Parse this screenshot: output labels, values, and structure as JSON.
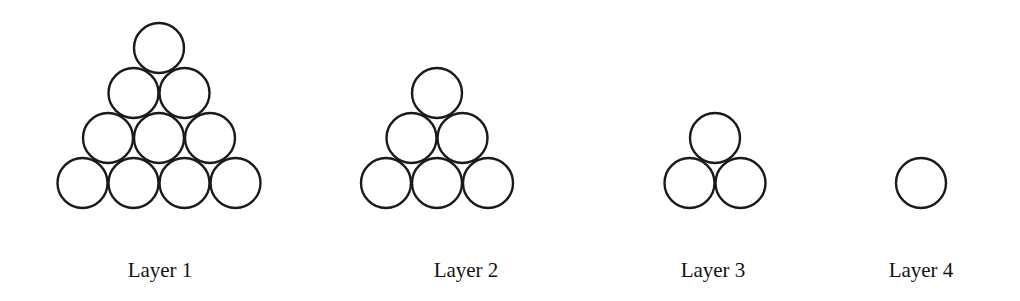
{
  "diagram": {
    "stroke_color": "#1a1a1a",
    "circle_radius": 25,
    "layers": [
      {
        "label": "Layer 1",
        "rows": 4,
        "count": 10,
        "center_x": 159,
        "label_x": 160
      },
      {
        "label": "Layer 2",
        "rows": 3,
        "count": 6,
        "center_x": 437,
        "label_x": 466
      },
      {
        "label": "Layer 3",
        "rows": 2,
        "count": 3,
        "center_x": 715,
        "label_x": 713
      },
      {
        "label": "Layer 4",
        "rows": 1,
        "count": 1,
        "center_x": 921,
        "label_x": 921
      }
    ]
  }
}
